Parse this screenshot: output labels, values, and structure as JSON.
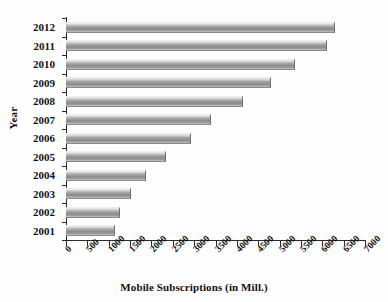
{
  "chart_data": {
    "type": "bar",
    "orientation": "horizontal",
    "title": "",
    "xlabel": "Mobile Subscriptions (in Mill.)",
    "ylabel": "Year",
    "categories": [
      "2012",
      "2011",
      "2010",
      "2009",
      "2008",
      "2007",
      "2006",
      "2005",
      "2004",
      "2003",
      "2002",
      "2001"
    ],
    "values": [
      6300,
      6100,
      5350,
      4800,
      4150,
      3400,
      2920,
      2350,
      1870,
      1520,
      1270,
      1140
    ],
    "xlim": [
      0,
      7000
    ],
    "xticks": [
      "0",
      "500",
      "1000",
      "1500",
      "2000",
      "2500",
      "3000",
      "3500",
      "4000",
      "4500",
      "5000",
      "5500",
      "6000",
      "6500",
      "7000"
    ],
    "xtick_values": [
      0,
      500,
      1000,
      1500,
      2000,
      2500,
      3000,
      3500,
      4000,
      4500,
      5000,
      5500,
      6000,
      6500,
      7000
    ],
    "grid": false,
    "legend": null,
    "legend_position": "none",
    "series": [
      {
        "name": "Mobile Subscriptions",
        "values": [
          6300,
          6100,
          5350,
          4800,
          4150,
          3400,
          2920,
          2350,
          1870,
          1520,
          1270,
          1140
        ]
      }
    ],
    "bar_color": "#9a9a9a",
    "axis_color": "#2b2b2b",
    "background_color": "#ffffff"
  }
}
